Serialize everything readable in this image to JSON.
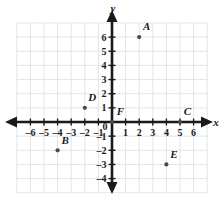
{
  "chart_data": {
    "type": "scatter",
    "title": "",
    "xlabel": "x",
    "ylabel": "y",
    "xlim": [
      -7,
      7
    ],
    "ylim": [
      -5,
      7
    ],
    "grid": true,
    "legend": "none",
    "x_ticks": [
      -6,
      -5,
      -4,
      -3,
      -2,
      -1,
      0,
      1,
      2,
      3,
      4,
      5,
      6
    ],
    "x_tick_labels": [
      "-6",
      "-5",
      "-4",
      "-3",
      "-2",
      "-1",
      "0",
      "1",
      "2",
      "3",
      "4",
      "5",
      "6"
    ],
    "y_ticks": [
      6,
      5,
      4,
      3,
      2,
      1,
      -1,
      -2,
      -3,
      -4
    ],
    "y_tick_labels": [
      "6",
      "5",
      "4",
      "3",
      "2",
      "1",
      "-1",
      "-2",
      "-3",
      "-4"
    ],
    "origin_label": "0",
    "points": [
      {
        "label": "A",
        "x": 2,
        "y": 6,
        "label_dx": 0.55,
        "label_dy": 0.75
      },
      {
        "label": "B",
        "x": -4,
        "y": -2,
        "label_dx": 0.55,
        "label_dy": 0.75
      },
      {
        "label": "C",
        "x": 5,
        "y": 0,
        "label_dx": 0.55,
        "label_dy": 0.75
      },
      {
        "label": "D",
        "x": -2,
        "y": 1,
        "label_dx": 0.55,
        "label_dy": 0.75
      },
      {
        "label": "E",
        "x": 4,
        "y": -3,
        "label_dx": 0.55,
        "label_dy": 0.75
      },
      {
        "label": "F",
        "x": 0,
        "y": 0,
        "label_dx": 0.62,
        "label_dy": 0.8
      }
    ],
    "colors": {
      "background": "#ffffff",
      "grid": "#e2e4e8",
      "axis": "#1a1a1a",
      "point": "#4a4a4a",
      "text": "#1a1a1a"
    }
  }
}
